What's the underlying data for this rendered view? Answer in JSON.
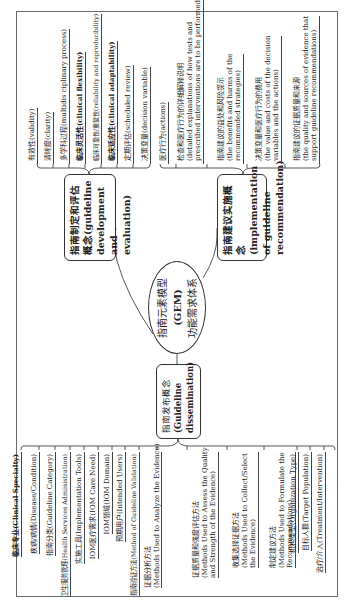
{
  "center": {
    "line1": "指南元素模型",
    "line2": "(GEM)",
    "line3": "功能需求体系"
  },
  "branches": {
    "dissemination": {
      "label_line1": "指南发布概念",
      "label_line2": "(Guideline",
      "label_line3": "dissemination)",
      "leaves": [
        {
          "lines": [
            "临床专业(Clinical Specialty)"
          ]
        },
        {
          "lines": [
            "疾病/病情(Disease/Condition)"
          ]
        },
        {
          "lines": [
            "指南分类(Guideline Category)"
          ]
        },
        {
          "lines": [
            "卫生服务管理(Health Services Administration)"
          ]
        },
        {
          "lines": [
            "实施工具(Implementation Tools)"
          ]
        },
        {
          "lines": [
            "IOM医疗需求(IOM Care Need)"
          ]
        },
        {
          "lines": [
            "IOM领域(IOM Domain)"
          ]
        },
        {
          "lines": [
            "预期用户(Intended Users)"
          ]
        },
        {
          "lines": [
            "指南验证方法(Method of Guideline Validation)"
          ]
        },
        {
          "lines": [
            "证据分析方法",
            "(Methods Used to Analyze the Evidence)"
          ]
        },
        {
          "lines": [
            "证据质量和强度评估方法",
            "(Methods Used to Assess the Quality",
            "and Strength of the Evidence)"
          ]
        },
        {
          "lines": [
            "收集选择证据方法",
            "(Methods Used to Collect/Select",
            "the Evidence)"
          ]
        },
        {
          "lines": [
            "制定建议方法",
            "(Methods Used to Formulate the",
            "Recommendations)"
          ]
        },
        {
          "lines": [
            "机构类型(Organization Type)"
          ]
        },
        {
          "lines": [
            "目标人群(Target Population)"
          ]
        },
        {
          "lines": [
            "治疗/介入(Treatment/Intervention)"
          ]
        }
      ]
    },
    "development": {
      "label_line1": "指南制定和评估",
      "label_line2": "概念(guideline",
      "label_line3": "development and",
      "label_line4": "evaluation)",
      "leaves": [
        {
          "lines": [
            "有效性(validity)"
          ]
        },
        {
          "lines": [
            "清晰度(clarity)"
          ]
        },
        {
          "lines": [
            "多学科过程(multidis ciplinary process)"
          ]
        },
        {
          "lines": [
            "临床灵活性(clinical flexibility)"
          ]
        },
        {
          "lines": [
            "临床可靠性/重复性(reliability and reproducibility)"
          ]
        },
        {
          "lines": [
            "临床适应性(clinical adaptability)"
          ]
        },
        {
          "lines": [
            "定期评估(scheduled review)"
          ]
        }
      ]
    },
    "implementation": {
      "label_line1": "指南建议实施概念",
      "label_line2": "(implementation",
      "label_line3": "of guideline",
      "label_line4": "recommendation)",
      "leaves": [
        {
          "lines": [
            "决策变量(decision variable)"
          ]
        },
        {
          "lines": [
            "医疗行为(actions)"
          ]
        },
        {
          "lines": [
            "检查和医疗行为的详细解释说明",
            "(detailed explanations of how tests and",
            "prescribed interventions are to be performed)"
          ]
        },
        {
          "lines": [
            "指南建议的益处和风险提示",
            "(the benefits and harms of the",
            "recommended strategies)"
          ]
        },
        {
          "lines": [
            "决策变量和医疗行为的费用",
            "(the value and costs of the decision",
            "variables and the actions)"
          ]
        },
        {
          "lines": [
            "指南建议的证据质量和来源",
            "(the quality and sources of evidence that",
            "support guideline recommendations)"
          ]
        }
      ]
    }
  },
  "colors": {
    "line": "#444444",
    "border": "#333333",
    "frame": "#6a6a6a",
    "text": "#222222",
    "background": "#ffffff"
  }
}
